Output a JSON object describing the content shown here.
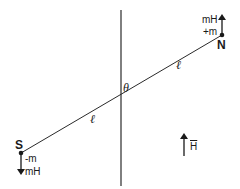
{
  "diagram": {
    "type": "magnetic-dipole-in-field",
    "colors": {
      "stroke": "#2a2a2a",
      "text": "#1a1a1a",
      "background": "#ffffff"
    },
    "vertical_axis": {
      "x": 121,
      "y1": 10,
      "y2": 186
    },
    "magnet_line": {
      "x1": 21,
      "y1": 153,
      "x2": 222,
      "y2": 35
    },
    "north_pole": {
      "label": "N",
      "charge_label": "+m",
      "force_label": "mH",
      "force_direction": "up"
    },
    "south_pole": {
      "label": "S",
      "charge_label": "-m",
      "force_label": "mH",
      "force_direction": "down"
    },
    "angle_label": "θ",
    "length_labels": [
      "ℓ",
      "ℓ"
    ],
    "field": {
      "label": "H",
      "direction": "up"
    }
  }
}
